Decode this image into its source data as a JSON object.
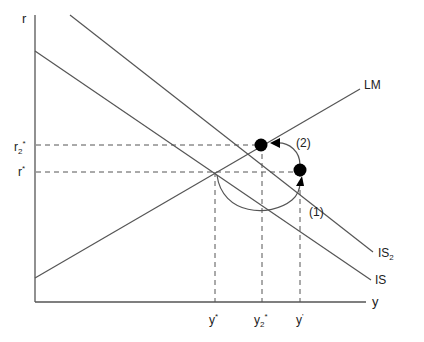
{
  "diagram": {
    "type": "IS-LM",
    "axes": {
      "x_label": "y",
      "y_label": "r"
    },
    "curves": [
      {
        "name": "LM",
        "label": "LM"
      },
      {
        "name": "IS2",
        "label": "IS",
        "subscript": "2"
      },
      {
        "name": "IS",
        "label": "IS"
      }
    ],
    "y_ticks": [
      {
        "label": "r",
        "subscript": "2",
        "superscript": "*"
      },
      {
        "label": "r",
        "subscript": "",
        "superscript": "*"
      }
    ],
    "x_ticks": [
      {
        "label": "y",
        "subscript": "",
        "superscript": "*"
      },
      {
        "label": "y",
        "subscript": "2",
        "superscript": "*"
      },
      {
        "label": "y",
        "subscript": "",
        "superscript": "'"
      }
    ],
    "annotations": [
      {
        "label": "(1)"
      },
      {
        "label": "(2)"
      }
    ],
    "colors": {
      "line": "#555555",
      "dot": "#000000",
      "text": "#222222"
    }
  }
}
